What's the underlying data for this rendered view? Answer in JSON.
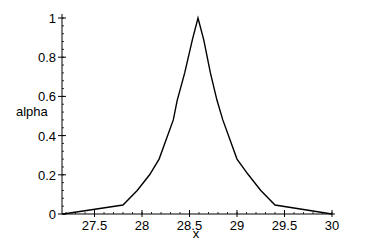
{
  "chart_data": {
    "type": "line",
    "title": "",
    "xlabel": "x",
    "ylabel": "alpha",
    "xlim": [
      27.17,
      30.0
    ],
    "ylim": [
      0,
      1
    ],
    "grid": false,
    "legend": null,
    "x_ticks": [
      27.5,
      28,
      28.5,
      29,
      29.5,
      30
    ],
    "x_tick_labels": [
      "27.5",
      "28",
      "28.5",
      "29",
      "29.5",
      "30"
    ],
    "y_ticks": [
      0,
      0.2,
      0.4,
      0.6,
      0.8,
      1
    ],
    "y_tick_labels": [
      "0",
      "0.2",
      "0.4",
      "0.6",
      "0.8",
      "1"
    ],
    "x_minor_step": 0.1,
    "y_minor_step": 0.04,
    "series": [
      {
        "name": "alpha",
        "color": "#000000",
        "x": [
          27.17,
          27.8,
          27.95,
          28.08,
          28.18,
          28.33,
          28.37,
          28.45,
          28.53,
          28.59,
          28.65,
          28.72,
          28.79,
          28.85,
          29.0,
          29.12,
          29.25,
          29.4,
          30.0
        ],
        "y": [
          0.0,
          0.046,
          0.12,
          0.2,
          0.28,
          0.48,
          0.58,
          0.72,
          0.89,
          1.0,
          0.89,
          0.72,
          0.58,
          0.48,
          0.28,
          0.2,
          0.12,
          0.046,
          0.0
        ]
      }
    ]
  }
}
